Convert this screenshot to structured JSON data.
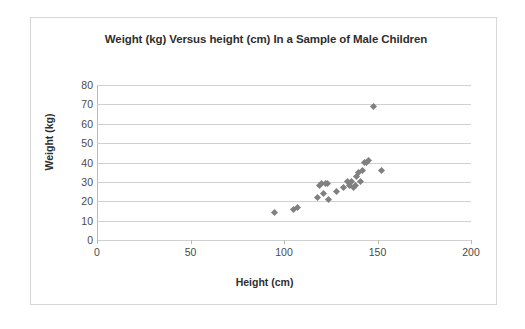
{
  "chart_data": {
    "type": "scatter",
    "title": "Weight (kg) Versus height (cm) In a Sample of Male Children",
    "xlabel": "Height (cm)",
    "ylabel": "Weight (kg)",
    "xlim": [
      0,
      200
    ],
    "ylim": [
      0,
      80
    ],
    "xticks": [
      0,
      50,
      100,
      150,
      200
    ],
    "yticks": [
      0,
      10,
      20,
      30,
      40,
      50,
      60,
      70,
      80
    ],
    "grid": "horizontal",
    "legend": "none",
    "marker": "diamond",
    "marker_color": "#808080",
    "series": [
      {
        "name": "Male children",
        "points": [
          [
            95,
            14
          ],
          [
            105,
            16
          ],
          [
            107,
            17
          ],
          [
            118,
            22
          ],
          [
            119,
            28
          ],
          [
            120,
            29
          ],
          [
            121,
            24
          ],
          [
            122,
            29
          ],
          [
            123,
            29
          ],
          [
            124,
            21
          ],
          [
            128,
            25
          ],
          [
            132,
            27
          ],
          [
            134,
            30
          ],
          [
            135,
            28
          ],
          [
            136,
            30
          ],
          [
            137,
            27
          ],
          [
            138,
            28
          ],
          [
            139,
            33
          ],
          [
            140,
            35
          ],
          [
            141,
            30
          ],
          [
            142,
            36
          ],
          [
            143,
            40
          ],
          [
            144,
            40
          ],
          [
            145,
            41
          ],
          [
            148,
            69
          ],
          [
            152,
            36
          ]
        ]
      }
    ]
  },
  "axes": {
    "x_tick_labels": [
      "0",
      "50",
      "100",
      "150",
      "200"
    ],
    "y_tick_labels": [
      "0",
      "10",
      "20",
      "30",
      "40",
      "50",
      "60",
      "70",
      "80"
    ]
  }
}
